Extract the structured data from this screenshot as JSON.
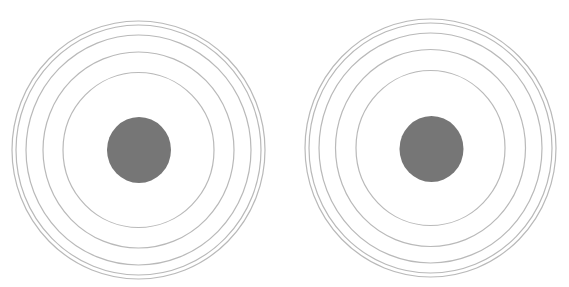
{
  "figure": {
    "background": "#ffffff",
    "ring_color": "#b9b9b9",
    "disc_color": "#767676",
    "targets": [
      {
        "name": "left-target",
        "cx": 138.5,
        "cy": 150,
        "rings": [
          {
            "rx": 126.5,
            "ry": 129
          },
          {
            "rx": 122.5,
            "ry": 125
          },
          {
            "rx": 112.5,
            "ry": 115
          },
          {
            "rx": 95.5,
            "ry": 98
          },
          {
            "rx": 75.5,
            "ry": 77.5
          }
        ],
        "disc": {
          "cx": 139,
          "cy": 150,
          "rx": 32,
          "ry": 33
        }
      },
      {
        "name": "right-target",
        "cx": 430.5,
        "cy": 148,
        "rings": [
          {
            "rx": 125.5,
            "ry": 129
          },
          {
            "rx": 121.5,
            "ry": 125
          },
          {
            "rx": 111.5,
            "ry": 115
          },
          {
            "rx": 95,
            "ry": 98.5
          },
          {
            "rx": 74.5,
            "ry": 77.5
          }
        ],
        "disc": {
          "cx": 431.5,
          "cy": 149,
          "rx": 32,
          "ry": 33
        }
      }
    ]
  }
}
